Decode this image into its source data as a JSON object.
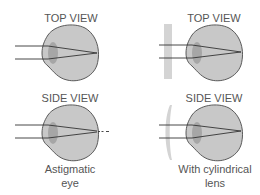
{
  "panels": {
    "astigmatic_top": {
      "label": "TOP VIEW"
    },
    "astigmatic_side": {
      "label": "SIDE VIEW"
    },
    "corrected_top": {
      "label": "TOP VIEW"
    },
    "corrected_side": {
      "label": "SIDE VIEW"
    }
  },
  "captions": {
    "left_line1": "Astigmatic",
    "left_line2": "eye",
    "right_line1": "With cylindrical",
    "right_line2": "lens"
  },
  "colors": {
    "eye_fill": "#c8c8c8",
    "eye_stroke": "#4a4a4a",
    "lens_fill": "#a0a0a0",
    "corrective_lens": "#d4d4d4",
    "ray": "#333333",
    "text": "#555555"
  }
}
